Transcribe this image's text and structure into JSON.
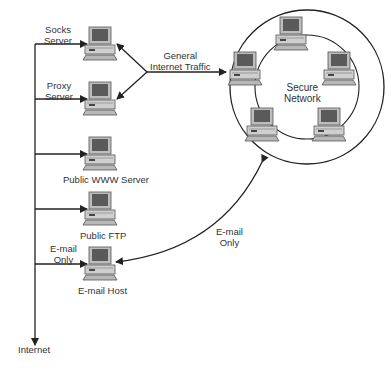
{
  "diagram": {
    "nodes": [
      {
        "id": "socks",
        "label_line1": "Socks",
        "label_line2": "Server",
        "icon": "computer-icon"
      },
      {
        "id": "proxy",
        "label_line1": "Proxy",
        "label_line2": "Server",
        "icon": "computer-icon"
      },
      {
        "id": "www",
        "label": "Public WWW Server",
        "icon": "computer-icon"
      },
      {
        "id": "ftp",
        "label": "Public FTP",
        "icon": "computer-icon"
      },
      {
        "id": "email",
        "label": "E-mail Host",
        "icon": "computer-icon"
      },
      {
        "id": "internet",
        "label": "Internet"
      },
      {
        "id": "secure",
        "label_line1": "Secure",
        "label_line2": "Network",
        "member_count": 5
      }
    ],
    "edges": [
      {
        "from": "internet",
        "to": "socks"
      },
      {
        "from": "internet",
        "to": "proxy"
      },
      {
        "from": "internet",
        "to": "www"
      },
      {
        "from": "internet",
        "to": "ftp"
      },
      {
        "from": "internet",
        "to": "email",
        "label_line1": "E-mail",
        "label_line2": "Only"
      },
      {
        "from": "secure",
        "to": [
          "socks",
          "proxy"
        ],
        "label_line1": "General",
        "label_line2": "Internet Traffic"
      },
      {
        "from": "secure",
        "to": "email",
        "bidirectional": true,
        "label_line1": "E-mail",
        "label_line2": "Only"
      }
    ],
    "colors": {
      "line": "#222222",
      "icon_body": "#c8c8c8",
      "icon_screen": "#555555"
    }
  }
}
